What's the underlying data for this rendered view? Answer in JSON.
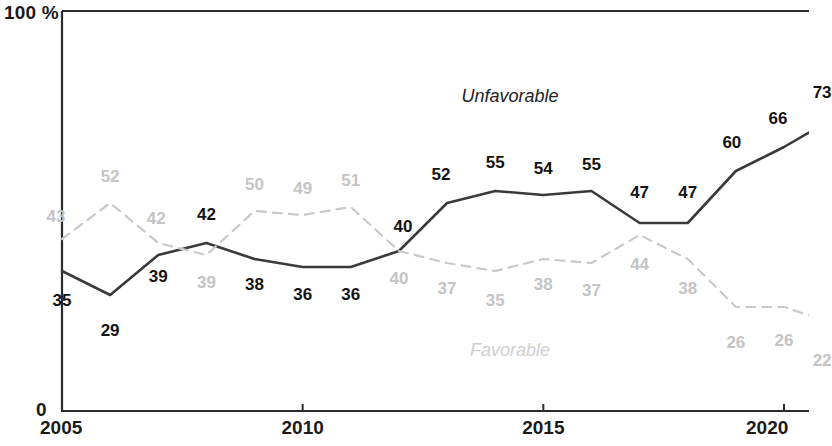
{
  "axes": {
    "y_max_label": "100 %",
    "y_min_label": "0",
    "x_ticks": [
      "2005",
      "2010",
      "2015",
      "2020"
    ]
  },
  "colors": {
    "unfavorable_line": "#3a3a3a",
    "favorable_line": "#c9c9c9",
    "unfavorable_text": "#141414",
    "favorable_text": "#c4c4c4",
    "axis": "#2b2b2b"
  },
  "chart_data": {
    "type": "line",
    "title": "",
    "xlabel": "",
    "ylabel": "",
    "ylim": [
      0,
      100
    ],
    "xlim": [
      2005,
      2021
    ],
    "grid": false,
    "legend_position": "inline-annotations",
    "x": [
      2005,
      2006,
      2007,
      2008,
      2009,
      2010,
      2011,
      2012,
      2013,
      2014,
      2015,
      2016,
      2017,
      2018,
      2019,
      2020,
      2021
    ],
    "tick_values": [
      2005,
      2010,
      2015,
      2020
    ],
    "series": [
      {
        "name": "Unfavorable",
        "style": "solid",
        "color": "#3a3a3a",
        "values": [
          35,
          29,
          39,
          42,
          38,
          36,
          36,
          40,
          52,
          55,
          54,
          55,
          47,
          47,
          60,
          66,
          73
        ],
        "labels": [
          "35",
          "29",
          "39",
          "42",
          "38",
          "36",
          "36",
          "40",
          "52",
          "55",
          "54",
          "55",
          "47",
          "47",
          "60",
          "66",
          "73"
        ],
        "label_offsets_px": [
          [
            0,
            30
          ],
          [
            0,
            36
          ],
          [
            0,
            22
          ],
          [
            0,
            -28
          ],
          [
            0,
            26
          ],
          [
            0,
            28
          ],
          [
            0,
            28
          ],
          [
            4,
            -24
          ],
          [
            -6,
            -28
          ],
          [
            0,
            -28
          ],
          [
            0,
            -26
          ],
          [
            0,
            -26
          ],
          [
            0,
            -30
          ],
          [
            0,
            -30
          ],
          [
            -4,
            -28
          ],
          [
            -6,
            -28
          ],
          [
            -10,
            -26
          ]
        ]
      },
      {
        "name": "Favorable",
        "style": "dashed",
        "color": "#c9c9c9",
        "values": [
          43,
          52,
          42,
          39,
          50,
          49,
          51,
          40,
          37,
          35,
          38,
          37,
          44,
          38,
          26,
          26,
          22
        ],
        "labels": [
          "43",
          "52",
          "42",
          "39",
          "50",
          "49",
          "51",
          "40",
          "37",
          "35",
          "38",
          "37",
          "44",
          "38",
          "26",
          "26",
          "22"
        ],
        "label_offsets_px": [
          [
            -6,
            -22
          ],
          [
            0,
            -26
          ],
          [
            -2,
            -24
          ],
          [
            0,
            28
          ],
          [
            0,
            -26
          ],
          [
            0,
            -26
          ],
          [
            0,
            -26
          ],
          [
            0,
            28
          ],
          [
            0,
            26
          ],
          [
            0,
            30
          ],
          [
            0,
            26
          ],
          [
            0,
            28
          ],
          [
            0,
            30
          ],
          [
            0,
            30
          ],
          [
            0,
            36
          ],
          [
            0,
            34
          ],
          [
            -10,
            38
          ]
        ]
      }
    ]
  }
}
